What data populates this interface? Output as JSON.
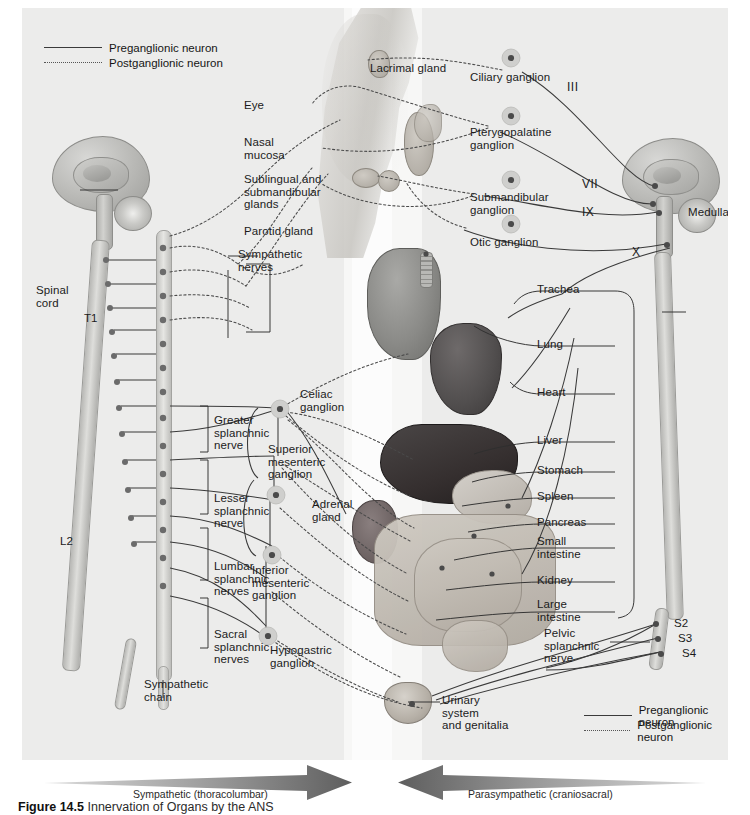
{
  "figure": {
    "caption_number": "Figure 14.5",
    "caption_text": "Innervation of Organs by the ANS"
  },
  "legend_top": {
    "preganglionic": "Preganglionic neuron",
    "postganglionic": "Postganglionic neuron"
  },
  "legend_bottom": {
    "preganglionic": "Preganglionic neuron",
    "postganglionic": "Postganglionic neuron"
  },
  "divisions": {
    "sympathetic": "Sympathetic (thoracolumbar)",
    "parasympathetic": "Parasympathetic (craniosacral)"
  },
  "head_targets": [
    {
      "id": "eye",
      "label": "Eye"
    },
    {
      "id": "nasal-mucosa",
      "label": "Nasal\nmucosa"
    },
    {
      "id": "sublingual-submandibular-glands",
      "label": "Sublingual and\nsubmandibular\nglands"
    },
    {
      "id": "parotid-gland",
      "label": "Parotid gland"
    },
    {
      "id": "lacrimal-gland",
      "label": "Lacrimal gland"
    }
  ],
  "parasympathetic_ganglia": [
    {
      "id": "ciliary",
      "label": "Ciliary ganglion"
    },
    {
      "id": "pterygopalatine",
      "label": "Pterygopalatine\nganglion"
    },
    {
      "id": "submandibular",
      "label": "Submandibular\nganglion"
    },
    {
      "id": "otic",
      "label": "Otic ganglion"
    }
  ],
  "cranial_nerves": [
    {
      "id": "oculomotor",
      "label": "III"
    },
    {
      "id": "facial",
      "label": "VII"
    },
    {
      "id": "glossopharyngeal",
      "label": "IX"
    },
    {
      "id": "vagus",
      "label": "X"
    }
  ],
  "cns_labels": {
    "spinal_cord": "Spinal\ncord",
    "medulla": "Medulla",
    "sympathetic_chain": "Sympathetic\nchain",
    "sympathetic_nerves": "Sympathetic\nnerves"
  },
  "spinal_markers": [
    {
      "id": "t1",
      "label": "T1"
    },
    {
      "id": "l2",
      "label": "L2"
    },
    {
      "id": "s2",
      "label": "S2"
    },
    {
      "id": "s3",
      "label": "S3"
    },
    {
      "id": "s4",
      "label": "S4"
    }
  ],
  "splanchnic_nerves": [
    {
      "id": "greater",
      "label": "Greater\nsplanchnic\nnerve"
    },
    {
      "id": "lesser",
      "label": "Lesser\nsplanchnic\nnerve"
    },
    {
      "id": "lumbar",
      "label": "Lumbar\nsplanchnic\nnerves"
    },
    {
      "id": "sacral",
      "label": "Sacral\nsplanchnic\nnerves"
    },
    {
      "id": "pelvic",
      "label": "Pelvic\nsplanchnic\nnerve"
    }
  ],
  "prevertebral_ganglia": [
    {
      "id": "celiac",
      "label": "Celiac\nganglion"
    },
    {
      "id": "superior-mesenteric",
      "label": "Superior\nmesenteric\nganglion"
    },
    {
      "id": "inferior-mesenteric",
      "label": "Inferior\nmesenteric\nganglion"
    },
    {
      "id": "hypogastric",
      "label": "Hypogastric\nganglion"
    }
  ],
  "adrenal": {
    "label": "Adrenal\ngland"
  },
  "organs": [
    {
      "id": "trachea",
      "label": "Trachea"
    },
    {
      "id": "lung",
      "label": "Lung"
    },
    {
      "id": "heart",
      "label": "Heart"
    },
    {
      "id": "liver",
      "label": "Liver"
    },
    {
      "id": "stomach",
      "label": "Stomach"
    },
    {
      "id": "spleen",
      "label": "Spleen"
    },
    {
      "id": "pancreas",
      "label": "Pancreas"
    },
    {
      "id": "small-intestine",
      "label": "Small\nintestine"
    },
    {
      "id": "kidney",
      "label": "Kidney"
    },
    {
      "id": "large-intestine",
      "label": "Large\nintestine"
    }
  ],
  "urinary": {
    "label": "Urinary\nsystem\nand genitalia"
  },
  "colors": {
    "panel_background": "#ececeb",
    "midline_band": "#f7f7f6",
    "preganglionic_line": "#3a3a3a",
    "postganglionic_line": "#4a4a4a",
    "label_text": "#1b1b1b",
    "arrow_fill": "#6e6e6e"
  }
}
